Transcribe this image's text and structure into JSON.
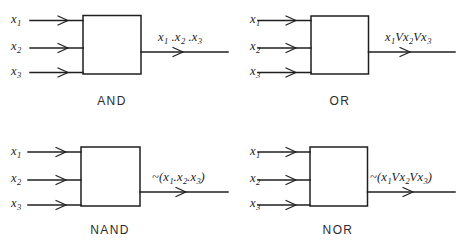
{
  "figure": {
    "background_color": "#ffffff",
    "ink_color": "#1f1f1f",
    "input_labels": [
      "x",
      "x",
      "x"
    ],
    "input_subscripts": [
      "1",
      "2",
      "3"
    ]
  },
  "gates": [
    {
      "id": "and",
      "caption": "AND",
      "inputs": [
        {
          "base": "x",
          "sub": "1"
        },
        {
          "base": "x",
          "sub": "2"
        },
        {
          "base": "x",
          "sub": "3"
        }
      ],
      "output_expression": {
        "prefix": "",
        "open": "",
        "operands": [
          {
            "base": "x",
            "sub": "1"
          },
          {
            "base": "x",
            "sub": "2"
          },
          {
            "base": "x",
            "sub": "3"
          }
        ],
        "operator": " .",
        "close": "",
        "plain_text": "x1 . x2 . x3"
      }
    },
    {
      "id": "or",
      "caption": "OR",
      "inputs": [
        {
          "base": "x",
          "sub": "1"
        },
        {
          "base": "x",
          "sub": "2"
        },
        {
          "base": "x",
          "sub": "3"
        }
      ],
      "output_expression": {
        "prefix": "",
        "open": "",
        "operands": [
          {
            "base": "x",
            "sub": "1"
          },
          {
            "base": "x",
            "sub": "2"
          },
          {
            "base": "x",
            "sub": "3"
          }
        ],
        "operator": "V",
        "close": "",
        "plain_text": "x1 V x2 V x3"
      }
    },
    {
      "id": "nand",
      "caption": "NAND",
      "inputs": [
        {
          "base": "x",
          "sub": "1"
        },
        {
          "base": "x",
          "sub": "2"
        },
        {
          "base": "x",
          "sub": "3"
        }
      ],
      "output_expression": {
        "prefix": "~",
        "open": "(",
        "operands": [
          {
            "base": "x",
            "sub": "1"
          },
          {
            "base": "x",
            "sub": "2"
          },
          {
            "base": "x",
            "sub": "3"
          }
        ],
        "operator": ".",
        "close": ")",
        "plain_text": "~(x1 . x2 . x3)"
      }
    },
    {
      "id": "nor",
      "caption": "NOR",
      "inputs": [
        {
          "base": "x",
          "sub": "1"
        },
        {
          "base": "x",
          "sub": "2"
        },
        {
          "base": "x",
          "sub": "3"
        }
      ],
      "output_expression": {
        "prefix": "~",
        "open": "(",
        "operands": [
          {
            "base": "x",
            "sub": "1"
          },
          {
            "base": "x",
            "sub": "2"
          },
          {
            "base": "x",
            "sub": "3"
          }
        ],
        "operator": "V",
        "close": ")",
        "plain_text": "~(x1 V x2 V x3)"
      }
    }
  ]
}
